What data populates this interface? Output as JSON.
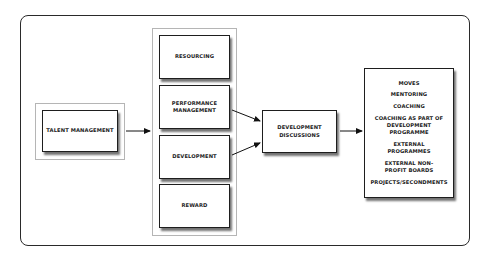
{
  "diagram": {
    "title": "",
    "source": {
      "label": "TALENT MANAGEMENT"
    },
    "processes": [
      {
        "label": "RESOURCING"
      },
      {
        "label": "PERFORMANCE MANAGEMENT"
      },
      {
        "label": "DEVELOPMENT"
      },
      {
        "label": "REWARD"
      }
    ],
    "hub": {
      "label": "DEVELOPMENT DISCUSSIONS"
    },
    "outcomes": [
      {
        "label": "MOVES"
      },
      {
        "label": "MENTORING"
      },
      {
        "label": "COACHING"
      },
      {
        "label": "COACHING AS PART OF DEVELOPMENT PROGRAMME"
      },
      {
        "label": "EXTERNAL PROGRAMMES"
      },
      {
        "label": "EXTERNAL NON-PROFIT BOARDS"
      },
      {
        "label": "PROJECTS/SECONDMENTS"
      }
    ],
    "edges": [
      {
        "from": "TALENT MANAGEMENT",
        "to": "process-group"
      },
      {
        "from": "PERFORMANCE MANAGEMENT",
        "to": "DEVELOPMENT DISCUSSIONS"
      },
      {
        "from": "DEVELOPMENT",
        "to": "DEVELOPMENT DISCUSSIONS"
      },
      {
        "from": "DEVELOPMENT DISCUSSIONS",
        "to": "outcomes"
      }
    ],
    "colors": {
      "border": "#1e1e1e",
      "group_border": "#b5b5b5",
      "background": "#ffffff"
    }
  }
}
